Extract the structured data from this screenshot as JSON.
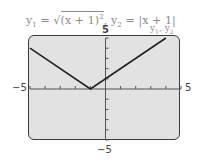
{
  "chart_data": {
    "type": "line",
    "title_parts": {
      "y1_label": "y",
      "y1_sub": "1",
      "eq1": " = ",
      "rad_content": "(x + 1)",
      "rad_exp": "2",
      "sep": ",  ",
      "y2_label": "y",
      "y2_sub": "2",
      "eq2": " = |x + 1|"
    },
    "series": [
      {
        "name": "y1, y2",
        "x": [
          -5,
          -1,
          5
        ],
        "y": [
          4,
          0,
          6
        ]
      }
    ],
    "series_label": {
      "y1": "y",
      "s1": "1",
      "comma": ", ",
      "y2": "y",
      "s2": "2"
    },
    "xlim": [
      -5,
      5
    ],
    "ylim": [
      -5,
      5
    ],
    "x_tick_labels": {
      "min": "−5",
      "max": "5"
    },
    "y_tick_labels": {
      "min": "−5",
      "max": "5"
    },
    "xscale": 1,
    "yscale": 1,
    "grid": false,
    "xlabel": "",
    "ylabel": ""
  }
}
